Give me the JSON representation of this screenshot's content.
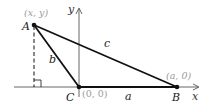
{
  "diagram": {
    "type": "coordinate-triangle",
    "axes": {
      "x_label": "x",
      "y_label": "y"
    },
    "vertices": [
      {
        "name": "A",
        "coord_label": "(x, y)"
      },
      {
        "name": "B",
        "coord_label": "(a, 0)"
      },
      {
        "name": "C",
        "coord_label": "(0, 0)"
      }
    ],
    "sides": [
      {
        "label": "a",
        "from": "C",
        "to": "B"
      },
      {
        "label": "b",
        "from": "A",
        "to": "C"
      },
      {
        "label": "c",
        "from": "A",
        "to": "B"
      }
    ],
    "annotations": {
      "altitude": "dashed perpendicular from A to x-axis",
      "right_angle_mark": true
    },
    "colors": {
      "line": "#111111",
      "axis": "#555555",
      "coord_text": "#9a9a9a"
    }
  }
}
